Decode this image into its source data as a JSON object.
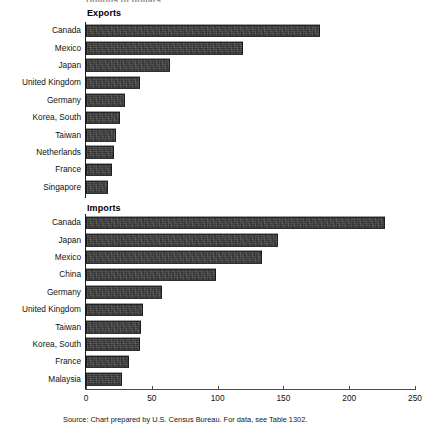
{
  "unit_caption": "Billions of dollars",
  "source_note": "Source: Chart prepared by U.S. Census Bureau. For data, see Table 1302.",
  "axis": {
    "ticks": [
      {
        "value": 0,
        "label": "0"
      },
      {
        "value": 50,
        "label": "50"
      },
      {
        "value": 100,
        "label": "100"
      },
      {
        "value": 150,
        "label": "150"
      },
      {
        "value": 200,
        "label": "200"
      },
      {
        "value": 250,
        "label": "250"
      }
    ]
  },
  "panels": {
    "exports": {
      "heading": "Exports"
    },
    "imports": {
      "heading": "Imports"
    }
  },
  "chart_data": [
    {
      "type": "bar",
      "title": "Exports",
      "orientation": "horizontal",
      "xlabel": "Billions of dollars",
      "ylabel": "",
      "xlim": [
        0,
        250
      ],
      "grid": false,
      "legend": "none",
      "categories": [
        "Canada",
        "Mexico",
        "Japan",
        "United Kingdom",
        "Germany",
        "Korea, South",
        "Taiwan",
        "Netherlands",
        "France",
        "Singapore"
      ],
      "values": [
        178,
        119,
        64,
        41,
        30,
        26,
        23,
        21,
        20,
        17
      ]
    },
    {
      "type": "bar",
      "title": "Imports",
      "orientation": "horizontal",
      "xlabel": "Billions of dollars",
      "ylabel": "",
      "xlim": [
        0,
        250
      ],
      "grid": false,
      "legend": "none",
      "categories": [
        "Canada",
        "Japan",
        "Mexico",
        "China",
        "Germany",
        "United Kingdom",
        "Taiwan",
        "Korea, South",
        "France",
        "Malaysia"
      ],
      "values": [
        227,
        146,
        134,
        99,
        58,
        43,
        42,
        41,
        33,
        27
      ]
    }
  ]
}
